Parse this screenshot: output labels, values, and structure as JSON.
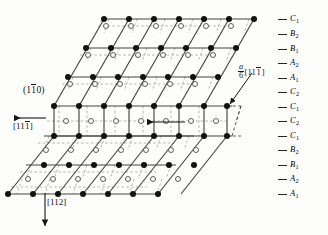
{
  "figure": {
    "type": "crystal-lattice-stacking-fault-diagram",
    "plane_label": "(110)",
    "plane_label_parts": {
      "open": "(1",
      "overbar": "1",
      "close": "0)"
    },
    "direction_left": {
      "open": "[11",
      "overbar": "1",
      "close": "]"
    },
    "direction_bottom": "[112]",
    "burgers": {
      "numerator": "a",
      "denominator": "6",
      "open": "[11",
      "overbar": "1",
      "close": "]"
    },
    "colors": {
      "atom_fill": "#111111",
      "atom_open_stroke": "#6d6a5c",
      "solid_line": "#4a4a46",
      "dashed_line": "#9b978a",
      "text": "#17150f",
      "background": "#fdfdfb"
    },
    "stacking_sequence": [
      {
        "letter": "C",
        "index": "1",
        "y": 19
      },
      {
        "letter": "B",
        "index": "2",
        "y": 34
      },
      {
        "letter": "B",
        "index": "1",
        "y": 49
      },
      {
        "letter": "A",
        "index": "2",
        "y": 63
      },
      {
        "letter": "A",
        "index": "1",
        "y": 78
      },
      {
        "letter": "C",
        "index": "2",
        "y": 92
      },
      {
        "letter": "C",
        "index": "1",
        "y": 107
      },
      {
        "letter": "C",
        "index": "2",
        "y": 121
      },
      {
        "letter": "C",
        "index": "1",
        "y": 136
      },
      {
        "letter": "B",
        "index": "2",
        "y": 150
      },
      {
        "letter": "B",
        "index": "1",
        "y": 165
      },
      {
        "letter": "A",
        "index": "2",
        "y": 179
      },
      {
        "letter": "A",
        "index": "1",
        "y": 194
      }
    ]
  }
}
